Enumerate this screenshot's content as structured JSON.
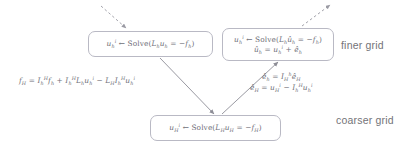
{
  "diagram": {
    "background_color": "#ffffff",
    "box_border_color": "#b9b9c4",
    "text_color": "#6f6f78",
    "arrow_color": "#8d8d96"
  },
  "nodes": {
    "fine_left": {
      "name": "fine-grid-initial-solve",
      "lines": [
        "u_h^i ← Solve(L_h u_h = −f_h)"
      ],
      "line1": {
        "var": "u",
        "var_sub": "h",
        "var_sup": "i",
        "arrow": "←",
        "op": "Solve(",
        "operator": "L",
        "operator_sub": "h",
        "unknown": "u",
        "unknown_sub": "h",
        "equals": "=",
        "minus": "−",
        "rhs": "f",
        "rhs_sub": "h",
        "close": ")"
      }
    },
    "fine_right": {
      "name": "fine-grid-corrected-solve",
      "lines": [
        "u_h^i ← Solve(L_h û_h = −f_h)",
        "û_h = u_h^i + ê_h"
      ],
      "line1": {
        "var": "u",
        "var_sub": "h",
        "var_sup": "i",
        "arrow": "←",
        "op": "Solve(",
        "operator": "L",
        "operator_sub": "h",
        "unknown": "û",
        "unknown_sub": "h",
        "equals": "=",
        "minus": "−",
        "rhs": "f",
        "rhs_sub": "h",
        "close": ")"
      },
      "line2": {
        "lhs": "û",
        "lhs_sub": "h",
        "equals": "=",
        "term1": "u",
        "term1_sub": "h",
        "term1_sup": "i",
        "plus": "+",
        "term2": "ê",
        "term2_sub": "h"
      }
    },
    "coarse": {
      "name": "coarse-grid-solve",
      "lines": [
        "u_H^i ← Solve(L_H u_H = −f_H)"
      ],
      "line1": {
        "var": "u",
        "var_sub": "H",
        "var_sup": "i",
        "arrow": "←",
        "op": "Solve(",
        "operator": "L",
        "operator_sub": "H",
        "unknown": "u",
        "unknown_sub": "H",
        "equals": "=",
        "minus": "−",
        "rhs": "f",
        "rhs_sub": "H",
        "close": ")"
      }
    }
  },
  "labels": {
    "finer_grid": "finer grid",
    "coarser_grid": "coarser grid"
  },
  "annotations": {
    "restriction": {
      "name": "coarse-rhs-equation",
      "text": "f_H = I_h^H f_h + I_h^H L_h u_h^i − L_H I_h^H u_h^i",
      "parts": {
        "lhs": "f",
        "lhs_sub": "H",
        "equals": "=",
        "t1_op": "I",
        "t1_sub": "h",
        "t1_sup": "H",
        "t1_var": "f",
        "t1_var_sub": "h",
        "plus": "+",
        "t2_op": "I",
        "t2_sub": "h",
        "t2_sup": "H",
        "t2_L": "L",
        "t2_L_sub": "h",
        "t2_u": "u",
        "t2_u_sub": "h",
        "t2_u_sup": "i",
        "minus": "−",
        "t3_L": "L",
        "t3_L_sub": "H",
        "t3_op": "I",
        "t3_sub": "h",
        "t3_sup": "H",
        "t3_u": "u",
        "t3_u_sub": "h",
        "t3_u_sup": "i"
      }
    },
    "prolongation": {
      "name": "error-correction-equations",
      "line1_text": "ê_h = I_H^h ê_H",
      "line2_text": "ê_H = u_H^i − I_h^H u_h^i",
      "line1": {
        "lhs": "ê",
        "lhs_sub": "h",
        "equals": "=",
        "op": "I",
        "op_sub": "H",
        "op_sup": "h",
        "var": "ê",
        "var_sub": "H"
      },
      "line2": {
        "lhs": "ê",
        "lhs_sub": "H",
        "equals": "=",
        "t1": "u",
        "t1_sub": "H",
        "t1_sup": "i",
        "minus": "−",
        "op": "I",
        "op_sub": "h",
        "op_sup": "H",
        "t2": "u",
        "t2_sub": "h",
        "t2_sup": "i"
      }
    }
  },
  "arrows": [
    {
      "name": "arrow-incoming-dashed",
      "style": "dashed",
      "from": "upper-left",
      "to": "fine-grid-initial-solve"
    },
    {
      "name": "arrow-restriction-solid",
      "style": "solid",
      "from": "fine-grid-initial-solve",
      "to": "coarse-grid-solve"
    },
    {
      "name": "arrow-prolongation-solid",
      "style": "solid",
      "from": "coarse-grid-solve",
      "to": "fine-grid-corrected-solve"
    },
    {
      "name": "arrow-outgoing-dashed",
      "style": "dashed",
      "from": "fine-grid-corrected-solve",
      "to": "upper-right"
    }
  ]
}
